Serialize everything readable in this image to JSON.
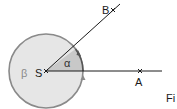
{
  "diagram": {
    "type": "angle-diagram",
    "vertex": {
      "label": "S",
      "x": 46,
      "y": 71
    },
    "points": [
      {
        "label": "A",
        "x": 140,
        "y": 71
      },
      {
        "label": "B",
        "x": 113,
        "y": 10
      }
    ],
    "angles": [
      {
        "label": "α",
        "description": "angle ASB (shaded sector)"
      },
      {
        "label": "β",
        "description": "reflex angle around S (circle)"
      }
    ],
    "caption_partial": "Fi"
  },
  "colors": {
    "line": "#1a1a1a",
    "circle_stroke": "#8a8a8a",
    "circle_fill": "#e6e6e6",
    "sector_fill": "#c8c8c8",
    "beta_label": "#8a8a8a"
  }
}
